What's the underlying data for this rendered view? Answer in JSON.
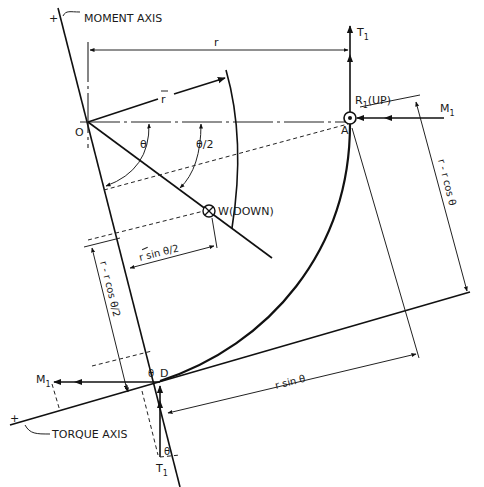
{
  "figure": {
    "type": "free-body diagram of curved beam segment",
    "colors": {
      "ink": "#111111",
      "background": "#ffffff"
    }
  },
  "axes": {
    "moment_axis": {
      "label": "MOMENT AXIS",
      "sign": "+"
    },
    "torque_axis": {
      "label": "TORQUE AXIS",
      "sign": "+"
    }
  },
  "points": {
    "O": "O",
    "A": "A",
    "D": "D"
  },
  "forces": {
    "T1_top": {
      "label": "T",
      "sub": "1"
    },
    "T1_bottom": {
      "label": "T",
      "sub": "1"
    },
    "M1_right": {
      "label": "M",
      "sub": "1"
    },
    "M1_left": {
      "label": "M",
      "sub": "1"
    },
    "R1": {
      "label": "R",
      "sub": "1",
      "suffix": "(UP)"
    },
    "W": {
      "label": "W(DOWN)"
    }
  },
  "dimensions": {
    "r": "r",
    "r_bar": "r",
    "theta": "θ",
    "theta_half": "θ/2",
    "r_minus_r_cos_theta": "r - r cos θ",
    "r_bar_sin_theta_half": "r sin θ/2",
    "r_minus_rbar_cos_theta_half": "r - r cos θ/2",
    "r_sin_theta": "r sin θ",
    "theta_at_D": "θ",
    "theta_at_T1": "θ"
  }
}
